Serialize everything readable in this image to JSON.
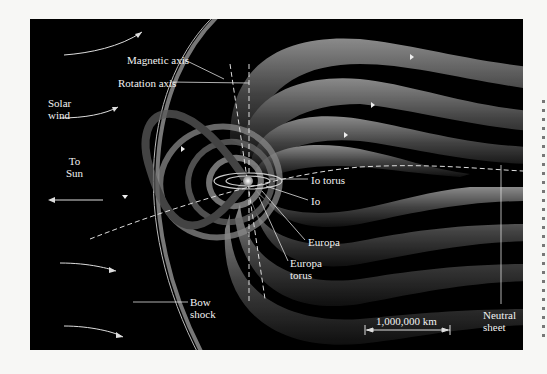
{
  "figure": {
    "background_color": "#000000",
    "page_color": "#f7f7f5",
    "field_line_color": "#8a8a8a",
    "label_color": "#f2f2f2"
  },
  "labels": {
    "solar_wind": [
      "Solar",
      "wind"
    ],
    "to_sun": [
      "To",
      "Sun"
    ],
    "magnetic_axis": "Magnetic axis",
    "rotation_axis": "Rotation axis",
    "io_torus": "Io torus",
    "io": "Io",
    "europa": "Europa",
    "europa_torus": [
      "Europa",
      "torus"
    ],
    "bow_shock": [
      "Bow",
      "shock"
    ],
    "neutral_sheet": [
      "Neutral",
      "sheet"
    ],
    "scale_bar": "1,000,000 km"
  }
}
